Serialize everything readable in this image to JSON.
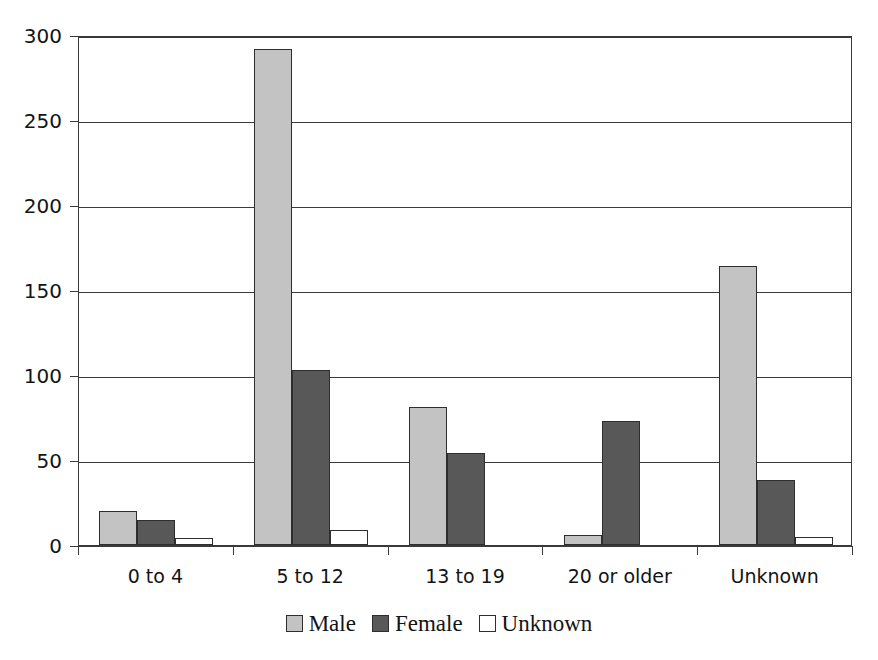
{
  "chart_data": {
    "type": "bar",
    "title": "",
    "subtitle": "",
    "xlabel": "",
    "ylabel": "",
    "categories": [
      "0 to 4",
      "5 to 12",
      "13 to 19",
      "20 or older",
      "Unknown"
    ],
    "series": [
      {
        "name": "Male",
        "color": "#c3c3c3",
        "values": [
          20,
          292,
          81,
          6,
          164
        ]
      },
      {
        "name": "Female",
        "color": "#585858",
        "values": [
          15,
          103,
          54,
          73,
          38
        ]
      },
      {
        "name": "Unknown",
        "color": "#ffffff",
        "values": [
          4,
          9,
          0,
          0,
          5
        ]
      }
    ],
    "ylim": [
      0,
      300
    ],
    "yticks": [
      0,
      50,
      100,
      150,
      200,
      250,
      300
    ],
    "ytick_labels": [
      "0",
      "50",
      "100",
      "150",
      "200",
      "250",
      "300"
    ],
    "grid": "horizontal",
    "legend_position": "bottom-center",
    "legend_entries": [
      "Male",
      "Female",
      "Unknown"
    ],
    "annotations": [],
    "axis_color": "#3a3a3a",
    "bar_border_color": "#2e2e2e",
    "background": "#ffffff"
  }
}
